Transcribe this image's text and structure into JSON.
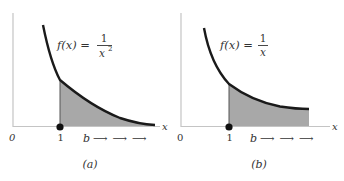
{
  "figures": [
    {
      "id": "a",
      "caption": "(a)",
      "function_lhs": "f(x) =",
      "numerator": "1",
      "denominator": "x",
      "exponent": "2",
      "axis_x_label": "x",
      "origin_label": "0",
      "tick_label": "1",
      "limit_label": "b",
      "arrows": "⟶ ⟶ ⟶",
      "colors": {
        "curve": "#1a1a1a",
        "shade": "#a8a8a8",
        "axis": "#bdbdbd"
      }
    },
    {
      "id": "b",
      "caption": "(b)",
      "function_lhs": "f(x) =",
      "numerator": "1",
      "denominator": "x",
      "exponent": "",
      "axis_x_label": "x",
      "origin_label": "0",
      "tick_label": "1",
      "limit_label": "b",
      "arrows": "⟶ ⟶ ⟶",
      "colors": {
        "curve": "#1a1a1a",
        "shade": "#a8a8a8",
        "axis": "#bdbdbd"
      }
    }
  ]
}
